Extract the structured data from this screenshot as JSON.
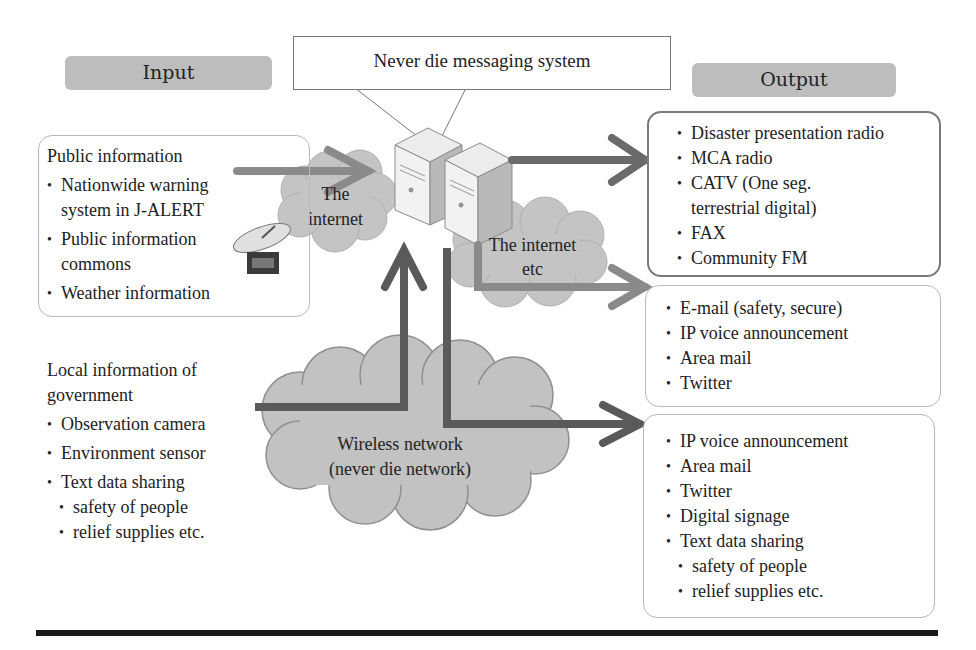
{
  "headers": {
    "input": "Input",
    "output": "Output"
  },
  "system": {
    "title": "Never die messaging system"
  },
  "clouds": {
    "internet_left": [
      "The",
      "internet"
    ],
    "internet_right": [
      "The internet",
      "etc"
    ],
    "wireless": [
      "Wireless network",
      "(never die network)"
    ]
  },
  "public_info": {
    "title": "Public information",
    "items": [
      {
        "lines": [
          "Nationwide warning",
          "system in J-ALERT"
        ]
      },
      {
        "lines": [
          "Public information",
          "commons"
        ]
      },
      {
        "lines": [
          "Weather information"
        ]
      }
    ]
  },
  "local_info": {
    "title_lines": [
      "Local information of",
      "government"
    ],
    "items": [
      "Observation camera",
      "Environment sensor",
      "Text data sharing"
    ],
    "sub_items": [
      "safety of people",
      "relief supplies etc."
    ]
  },
  "output_box_1": {
    "items": [
      {
        "lines": [
          "Disaster presentation radio"
        ]
      },
      {
        "lines": [
          "MCA radio"
        ]
      },
      {
        "lines": [
          "CATV (One seg.",
          "terrestrial digital)"
        ]
      },
      {
        "lines": [
          "FAX"
        ]
      },
      {
        "lines": [
          "Community FM"
        ]
      }
    ]
  },
  "output_box_2": {
    "items": [
      "E-mail (safety, secure)",
      "IP voice announcement",
      "Area mail",
      "Twitter"
    ]
  },
  "output_box_3": {
    "items": [
      "IP voice announcement",
      "Area mail",
      "Twitter",
      "Digital signage",
      "Text data sharing"
    ],
    "sub_items": [
      "safety of people",
      "relief supplies etc."
    ]
  },
  "icons": {
    "server": "server-icon",
    "satellite": "satellite-dish-icon"
  },
  "colors": {
    "header_fill": "#bdbdbd",
    "cloud_fill": "#c4c4c4",
    "arrow_dark": "#5a5a5a",
    "arrow_light": "#8a8a8a",
    "rule": "#1a1a1a"
  }
}
